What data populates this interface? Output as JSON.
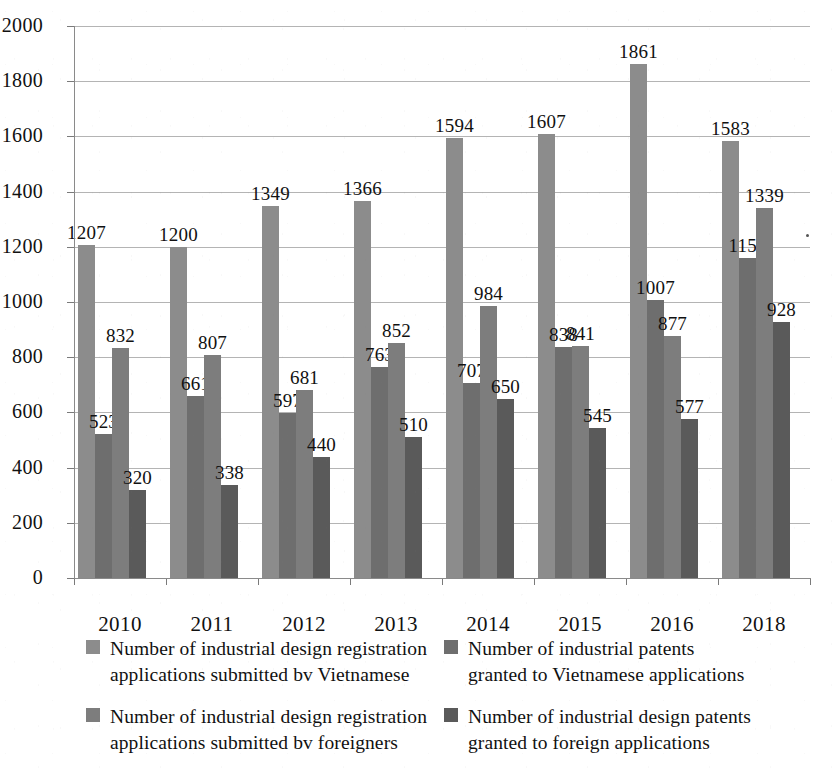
{
  "chart_data": {
    "type": "bar",
    "title": "",
    "xlabel": "",
    "ylabel": "",
    "ylim": [
      0,
      2000
    ],
    "ytick_step": 200,
    "yticks": [
      2000,
      1800,
      1600,
      1400,
      1200,
      1000,
      800,
      600,
      400,
      200,
      0
    ],
    "grid": true,
    "legend_position": "bottom",
    "categories": [
      "2010",
      "2011",
      "2012",
      "2013",
      "2014",
      "2015",
      "2016",
      "2018"
    ],
    "series": [
      {
        "name": "Number of industrial design registration applications submitted bv Vietnamese",
        "name_line1": "Number of industrial design registration",
        "name_line2": "applications submitted bv Vietnamese",
        "color": "#8c8c8c",
        "values": [
          1207,
          1200,
          1349,
          1366,
          1594,
          1607,
          1861,
          1583
        ]
      },
      {
        "name": "Number of industrial patents granted to Vietnamese applications",
        "name_line1": "Number of industrial patents",
        "name_line2": "granted to Vietnamese applications",
        "color": "#6e6e6e",
        "values": [
          523,
          661,
          597,
          763,
          707,
          838,
          1007,
          1158
        ]
      },
      {
        "name": "Number of industrial design registration applications submitted bv foreigners",
        "name_line1": "Number of industrial design registration",
        "name_line2": "applications submitted bv foreigners",
        "color": "#7d7d7d",
        "values": [
          832,
          807,
          681,
          852,
          984,
          841,
          877,
          1339
        ]
      },
      {
        "name": "Number of industrial design patents granted to foreign applications",
        "name_line1": "Number of industrial design patents",
        "name_line2": "granted to foreign applications",
        "color": "#5a5a5a",
        "values": [
          320,
          338,
          440,
          510,
          650,
          545,
          577,
          928
        ]
      }
    ]
  },
  "legend": {
    "columns": [
      {
        "entries": [
          0,
          2
        ]
      },
      {
        "entries": [
          1,
          3
        ]
      }
    ]
  }
}
